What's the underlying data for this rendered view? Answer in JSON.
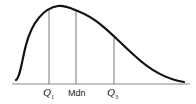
{
  "diagram": {
    "type": "right-skewed distribution curve with quartile markers",
    "colors": {
      "curve": "#111111",
      "lines": "#555555",
      "axis": "#777777"
    },
    "markers": [
      {
        "id": "q1",
        "label": "Q",
        "sub": "1",
        "x": 49,
        "top": 10
      },
      {
        "id": "mdn",
        "label": "Mdn",
        "sub": "",
        "x": 76,
        "top": 11
      },
      {
        "id": "q3",
        "label": "Q",
        "sub": "3",
        "x": 114,
        "top": 38
      }
    ]
  }
}
